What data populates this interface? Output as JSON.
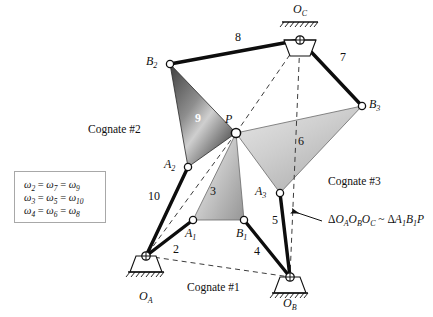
{
  "figure": {
    "width": 433,
    "height": 317
  },
  "colors": {
    "stroke": "#101010",
    "link": "#0d0d0d",
    "dashed": "#4a4a4a",
    "tri9_dark": "#4e4e4e",
    "tri9_light": "#c6c6c6",
    "tri3_dark": "#9c9c9c",
    "tri3_light": "#e2e2e2",
    "tri6_dark": "#a9a9a9",
    "tri6_light": "#dcdcdc",
    "joint_fill": "#ffffff",
    "box_border": "#a8a8a8"
  },
  "joints": [
    {
      "name": "O_C",
      "label": "O",
      "sub": "C",
      "x": 300,
      "y": 40,
      "type": "ground",
      "label_x": 293,
      "label_y": 5
    },
    {
      "name": "O_A",
      "label": "O",
      "sub": "A",
      "x": 146,
      "y": 256,
      "type": "ground",
      "label_x": 139,
      "label_y": 292
    },
    {
      "name": "O_B",
      "label": "O",
      "sub": "B",
      "x": 290,
      "y": 277,
      "type": "ground",
      "label_x": 283,
      "label_y": 299
    },
    {
      "name": "P",
      "label": "P",
      "sub": "",
      "x": 236,
      "y": 133,
      "type": "pin",
      "label_x": 226,
      "label_y": 114
    },
    {
      "name": "B_2",
      "label": "B",
      "sub": "2",
      "x": 170,
      "y": 64,
      "type": "pin",
      "label_x": 147,
      "label_y": 56
    },
    {
      "name": "A_2",
      "label": "A",
      "sub": "2",
      "x": 188,
      "y": 167,
      "type": "pin",
      "label_x": 165,
      "label_y": 159
    },
    {
      "name": "A_1",
      "label": "A",
      "sub": "1",
      "x": 193,
      "y": 220,
      "type": "pin",
      "label_x": 185,
      "label_y": 229
    },
    {
      "name": "B_1",
      "label": "B",
      "sub": "1",
      "x": 244,
      "y": 220,
      "type": "pin",
      "label_x": 236,
      "label_y": 229
    },
    {
      "name": "A_3",
      "label": "A",
      "sub": "3",
      "x": 280,
      "y": 193,
      "type": "pin",
      "label_x": 256,
      "label_y": 186
    },
    {
      "name": "B_3",
      "label": "B",
      "sub": "3",
      "x": 362,
      "y": 106,
      "type": "pin",
      "label_x": 369,
      "label_y": 99
    }
  ],
  "links": [
    {
      "number": "2",
      "from": "O_A",
      "to": "A_1",
      "label_x": 173,
      "label_y": 243
    },
    {
      "number": "3",
      "from": "A_1",
      "to": "P",
      "label_x": 213,
      "label_y": 190
    },
    {
      "number": "4",
      "from": "B_1",
      "to": "O_B",
      "label_x": 256,
      "label_y": 246
    },
    {
      "number": "5",
      "from": "A_3",
      "to": "O_B",
      "label_x": 274,
      "label_y": 216
    },
    {
      "number": "6",
      "from": "A_3",
      "to": "B_3",
      "label_x": 300,
      "label_y": 141
    },
    {
      "number": "7",
      "from": "O_C",
      "to": "B_3",
      "label_x": 341,
      "label_y": 58
    },
    {
      "number": "8",
      "from": "B_2",
      "to": "O_C",
      "label_x": 236,
      "label_y": 38
    },
    {
      "number": "9",
      "from": "B_2",
      "to": "A_2",
      "label_x": 197,
      "label_y": 118
    },
    {
      "number": "10",
      "from": "O_A",
      "to": "A_2",
      "label_x": 151,
      "label_y": 196
    }
  ],
  "triangles": [
    {
      "name": "triangle-9",
      "vertices": "B_2,P,A_2",
      "number": "9",
      "shade": "dark"
    },
    {
      "name": "triangle-3",
      "vertices": "P,B_1,A_1",
      "number": "3",
      "shade": "light"
    },
    {
      "name": "triangle-6",
      "vertices": "P,B_3,A_3",
      "number": "6",
      "shade": "light"
    }
  ],
  "dashed_lines": [
    {
      "name": "dashed-OA-OB",
      "from": "O_A",
      "to": "O_B"
    },
    {
      "name": "dashed-OC-P",
      "from": "O_C",
      "to": "P"
    },
    {
      "name": "dashed-OC-OB",
      "from": "O_C",
      "to": "O_B"
    },
    {
      "name": "dashed-P-OA",
      "from": "P",
      "to": "O_A"
    }
  ],
  "cognate_labels": [
    {
      "name": "cognate-1",
      "text": "Cognate #1",
      "x": 215,
      "y": 288
    },
    {
      "name": "cognate-2",
      "text": "Cognate #2",
      "x": 135,
      "y": 131
    },
    {
      "name": "cognate-3",
      "text": "Cognate #3",
      "x": 355,
      "y": 183
    }
  ],
  "omega_box": {
    "equations": [
      {
        "lhs": "ω",
        "lhs_sub": "2",
        "mid": "ω",
        "mid_sub": "7",
        "rhs": "ω",
        "rhs_sub": "9"
      },
      {
        "lhs": "ω",
        "lhs_sub": "3",
        "mid": "ω",
        "mid_sub": "5",
        "rhs": "ω",
        "rhs_sub": "10"
      },
      {
        "lhs": "ω",
        "lhs_sub": "4",
        "mid": "ω",
        "mid_sub": "6",
        "rhs": "ω",
        "rhs_sub": "8"
      }
    ],
    "equals": "="
  },
  "similarity_note": {
    "name": "similarity-annotation",
    "delta": "Δ",
    "tilde": "~",
    "left": "O",
    "left_sub1": "A",
    "left_mid": "O",
    "left_sub2": "B",
    "left_right": "O",
    "left_sub3": "C",
    "right_a": "A",
    "right_a_sub": "1",
    "right_b": "B",
    "right_b_sub": "1",
    "right_p": "P",
    "full_text": "ΔOₐO_BO_C ~ ΔA₁B₁P",
    "x": 330,
    "y": 221,
    "arrow_tip_x": 290,
    "arrow_tip_y": 212,
    "arrow_tail_x": 322,
    "arrow_tail_y": 221
  }
}
